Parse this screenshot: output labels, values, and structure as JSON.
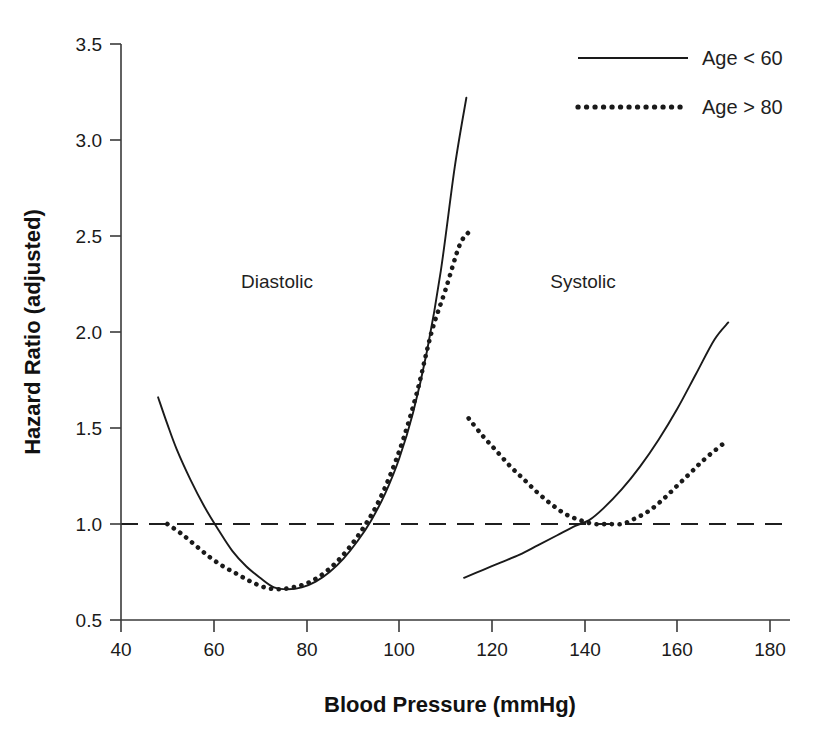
{
  "chart_data": {
    "type": "line",
    "title": "",
    "xlabel": "Blood Pressure (mmHg)",
    "ylabel": "Hazard Ratio (adjusted)",
    "xlim": [
      40,
      180
    ],
    "ylim": [
      0.5,
      3.5
    ],
    "xticks": [
      "40",
      "60",
      "80",
      "100",
      "120",
      "140",
      "160",
      "180"
    ],
    "xtick_values": [
      40,
      60,
      80,
      100,
      120,
      140,
      160,
      180
    ],
    "yticks": [
      "0.5",
      "1.0",
      "1.5",
      "2.0",
      "2.5",
      "3.0",
      "3.5"
    ],
    "ytick_values": [
      0.5,
      1.0,
      1.5,
      2.0,
      2.5,
      3.0,
      3.5
    ],
    "grid": false,
    "legend_position": "top-right",
    "reference_line": {
      "y": 1.0,
      "style": "dashed",
      "label": ""
    },
    "annotations": [
      {
        "text": "Diastolic",
        "x": 73,
        "y": 2.28
      },
      {
        "text": "Systolic",
        "x": 139,
        "y": 2.28
      }
    ],
    "legend": [
      {
        "name": "Age < 60",
        "style": "solid"
      },
      {
        "name": "Age > 80",
        "style": "dotted"
      }
    ],
    "series": [
      {
        "name": "Diastolic, Age < 60",
        "group": "Diastolic",
        "legend": "Age < 60",
        "style": "solid",
        "x": [
          48,
          50,
          52,
          55,
          58,
          61,
          64,
          67,
          70,
          73,
          76,
          79,
          82,
          85,
          88,
          91,
          94,
          97,
          100,
          103,
          106,
          109,
          112,
          114.5
        ],
        "y": [
          1.66,
          1.52,
          1.39,
          1.23,
          1.09,
          0.97,
          0.86,
          0.78,
          0.72,
          0.67,
          0.66,
          0.67,
          0.7,
          0.75,
          0.82,
          0.91,
          1.02,
          1.16,
          1.34,
          1.58,
          1.9,
          2.32,
          2.86,
          3.22
        ]
      },
      {
        "name": "Diastolic, Age > 80",
        "group": "Diastolic",
        "legend": "Age > 80",
        "style": "dotted",
        "x": [
          50,
          53,
          56,
          59,
          62,
          65,
          68,
          71,
          74,
          77,
          80,
          83,
          86,
          89,
          92,
          95,
          98,
          101,
          104,
          107,
          110,
          113,
          115
        ],
        "y": [
          1.0,
          0.95,
          0.89,
          0.83,
          0.78,
          0.74,
          0.7,
          0.67,
          0.66,
          0.67,
          0.69,
          0.73,
          0.79,
          0.87,
          0.97,
          1.09,
          1.25,
          1.45,
          1.7,
          2.0,
          2.22,
          2.45,
          2.52
        ]
      },
      {
        "name": "Systolic, Age < 60",
        "group": "Systolic",
        "legend": "Age < 60",
        "style": "solid",
        "x": [
          114,
          118,
          122,
          126,
          130,
          134,
          138,
          141,
          144,
          148,
          152,
          156,
          160,
          164,
          168,
          171
        ],
        "y": [
          0.72,
          0.76,
          0.8,
          0.84,
          0.89,
          0.94,
          0.99,
          1.02,
          1.08,
          1.18,
          1.3,
          1.44,
          1.6,
          1.78,
          1.96,
          2.05
        ]
      },
      {
        "name": "Systolic, Age > 80",
        "group": "Systolic",
        "legend": "Age > 80",
        "style": "dotted",
        "x": [
          115,
          118,
          121,
          124,
          127,
          130,
          133,
          136,
          139,
          142,
          145,
          148,
          151,
          154,
          157,
          160,
          163,
          166,
          170
        ],
        "y": [
          1.55,
          1.46,
          1.38,
          1.3,
          1.23,
          1.16,
          1.1,
          1.05,
          1.02,
          1.0,
          1.0,
          1.0,
          1.03,
          1.07,
          1.13,
          1.2,
          1.27,
          1.34,
          1.42
        ]
      }
    ]
  },
  "colors": {
    "background": "#ffffff",
    "curve": "#1a1a1a",
    "axis": "#3a3a3a",
    "text": "#1a1a1a"
  }
}
